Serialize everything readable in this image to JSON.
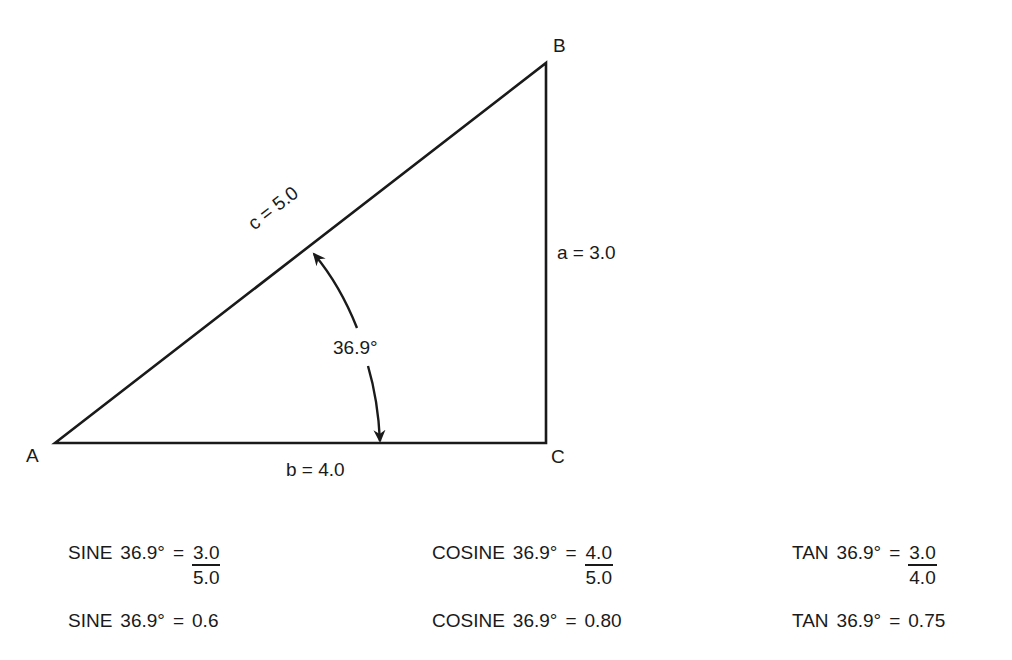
{
  "diagram": {
    "vertices": {
      "A": {
        "label": "A",
        "x": 55,
        "y": 443
      },
      "B": {
        "label": "B",
        "x": 546,
        "y": 63
      },
      "C": {
        "label": "C",
        "x": 546,
        "y": 443
      }
    },
    "sides": {
      "c": "c  =  5.0",
      "a": "a = 3.0",
      "b": "b  =  4.0"
    },
    "angle_label": "36.9°",
    "stroke_color": "#1a1a1a"
  },
  "formulas": {
    "row1": [
      {
        "func": "SINE",
        "angle": "36.9°",
        "eq": "=",
        "num": "3.0",
        "den": "5.0"
      },
      {
        "func": "COSINE",
        "angle": "36.9°",
        "eq": "=",
        "num": "4.0",
        "den": "5.0"
      },
      {
        "func": "TAN",
        "angle": "36.9°",
        "eq": "=",
        "num": "3.0",
        "den": "4.0"
      }
    ],
    "row2": [
      {
        "func": "SINE",
        "angle": "36.9°",
        "eq": "=",
        "value": "0.6"
      },
      {
        "func": "COSINE",
        "angle": "36.9°",
        "eq": "=",
        "value": "0.80"
      },
      {
        "func": "TAN",
        "angle": "36.9°",
        "eq": "=",
        "value": "0.75"
      }
    ]
  }
}
